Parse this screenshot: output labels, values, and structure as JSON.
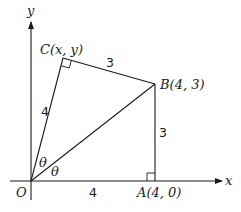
{
  "diagram": {
    "axes": {
      "x_label": "x",
      "y_label": "y",
      "origin_label": "O"
    },
    "points": {
      "O": {
        "label": "O",
        "coords": "(0, 0)"
      },
      "A": {
        "label": "A(4, 0)"
      },
      "B": {
        "label": "B(4, 3)"
      },
      "C": {
        "label": "C(x, y)"
      }
    },
    "segments": {
      "OA": {
        "length_label": "4"
      },
      "AB": {
        "length_label": "3"
      },
      "BC": {
        "length_label": "3"
      },
      "OC": {
        "length_label": "4"
      }
    },
    "angles": {
      "AOB": {
        "label": "θ"
      },
      "BOC": {
        "label": "θ"
      }
    },
    "right_angle_markers": [
      "A",
      "C"
    ]
  }
}
